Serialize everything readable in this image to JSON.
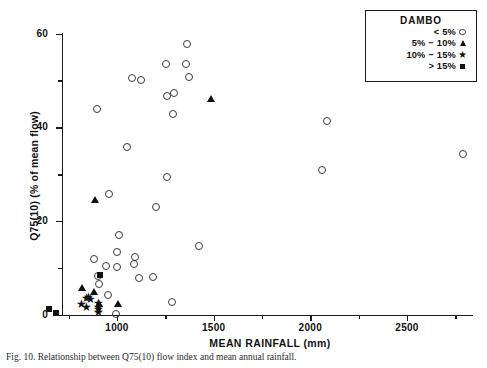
{
  "chart_data": {
    "type": "scatter",
    "title": "",
    "xlabel": "MEAN RAINFALL (mm)",
    "ylabel": "Q75(10) (% of mean flow)",
    "xlim": [
      600,
      2850
    ],
    "ylim": [
      0,
      60
    ],
    "xticks": [
      1000,
      1500,
      2000,
      2500
    ],
    "xtick_labels": [
      "1000",
      "1500",
      "2000",
      "2500"
    ],
    "xminor_ticks": [
      750,
      1250,
      1750,
      2250,
      2750
    ],
    "yticks": [
      0,
      20,
      40,
      60
    ],
    "ytick_labels": [
      "0",
      "20",
      "40",
      "60"
    ],
    "yminor_ticks": [
      10,
      30,
      50
    ],
    "grid": false,
    "legend_position": "top-right",
    "legend_title": "DAMBO",
    "series": [
      {
        "name": "< 5%",
        "marker": "open-circle",
        "color": "#3a3a3a",
        "points": [
          [
            895,
            44.0
          ],
          [
            955,
            25.8
          ],
          [
            1075,
            50.5
          ],
          [
            1120,
            50.2
          ],
          [
            1250,
            53.5
          ],
          [
            1355,
            53.5
          ],
          [
            1360,
            57.8
          ],
          [
            1370,
            50.8
          ],
          [
            1255,
            46.8
          ],
          [
            1295,
            47.3
          ],
          [
            1290,
            43.0
          ],
          [
            2085,
            41.5
          ],
          [
            1050,
            36.0
          ],
          [
            1255,
            29.5
          ],
          [
            2060,
            31.0
          ],
          [
            2790,
            34.5
          ],
          [
            1200,
            23.2
          ],
          [
            1010,
            17.2
          ],
          [
            1000,
            13.5
          ],
          [
            1090,
            12.5
          ],
          [
            1085,
            11.0
          ],
          [
            880,
            12.0
          ],
          [
            940,
            10.5
          ],
          [
            1000,
            10.3
          ],
          [
            1420,
            14.8
          ],
          [
            900,
            8.3
          ],
          [
            1110,
            8.0
          ],
          [
            1185,
            8.2
          ],
          [
            905,
            6.8
          ],
          [
            950,
            4.3
          ],
          [
            1280,
            2.8
          ],
          [
            995,
            0.3
          ]
        ]
      },
      {
        "name": "5% - 10%",
        "marker": "filled-triangle",
        "color": "#111111",
        "points": [
          [
            1485,
            46.0
          ],
          [
            885,
            24.5
          ],
          [
            820,
            5.8
          ],
          [
            880,
            5.0
          ],
          [
            905,
            2.4
          ],
          [
            1005,
            2.3
          ]
        ]
      },
      {
        "name": "10% - 15%",
        "marker": "filled-star",
        "color": "#111111",
        "points": [
          [
            838,
            3.6
          ],
          [
            850,
            3.9
          ],
          [
            858,
            3.4
          ],
          [
            812,
            2.4
          ],
          [
            900,
            2.5
          ],
          [
            900,
            1.8
          ],
          [
            900,
            1.2
          ],
          [
            900,
            0.6
          ],
          [
            838,
            1.6
          ]
        ]
      },
      {
        "name": "> 15%",
        "marker": "filled-square",
        "color": "#111111",
        "points": [
          [
            912,
            8.6
          ],
          [
            650,
            1.2
          ],
          [
            685,
            0.4
          ]
        ]
      }
    ]
  },
  "legend": {
    "title": "DAMBO",
    "entries": [
      {
        "label": "< 5%",
        "marker": "open-circle"
      },
      {
        "label": "5% − 10%",
        "marker": "filled-triangle"
      },
      {
        "label": "10% − 15%",
        "marker": "filled-star"
      },
      {
        "label": "> 15%",
        "marker": "filled-square"
      }
    ]
  },
  "axes": {
    "x_title": "MEAN RAINFALL (mm)",
    "y_title": "Q75(10) (% of mean flow)",
    "x_tick_labels": [
      "1000",
      "1500",
      "2000",
      "2500"
    ],
    "y_tick_labels": [
      "0",
      "20",
      "40",
      "60"
    ]
  },
  "caption": {
    "text": "Fig. 10.  Relationship between Q75(10) flow index and mean annual rainfall."
  }
}
